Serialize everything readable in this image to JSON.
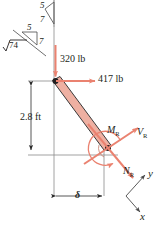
{
  "figure": {
    "type": "free-body-diagram",
    "title": "",
    "colors": {
      "member_fill": "#eeb0a2",
      "member_edge": "#3a3a3a",
      "force_arrow": "#ea8270",
      "reaction_arrow": "#ea8270",
      "line": "#555555",
      "text": "#231f20"
    },
    "forces": [
      {
        "id": "vertical-load",
        "label": "320 lb",
        "direction": "down",
        "magnitude": 320,
        "unit": "lb"
      },
      {
        "id": "horizontal-load",
        "label": "417 lb",
        "direction": "right",
        "magnitude": 417,
        "unit": "lb"
      }
    ],
    "reactions": [
      {
        "id": "moment",
        "label": "M",
        "subscript": "R"
      },
      {
        "id": "shear",
        "label": "V",
        "subscript": "R"
      },
      {
        "id": "normal",
        "label": "N",
        "subscript": "R"
      }
    ],
    "dimensions": [
      {
        "id": "vertical-dim",
        "label": "2.8 ft",
        "value": 2.8,
        "unit": "ft",
        "orientation": "vertical"
      },
      {
        "id": "horizontal-dim",
        "label": "δ",
        "value": null,
        "unit": "",
        "orientation": "horizontal"
      }
    ],
    "slope_triangles": [
      {
        "id": "upper-slope-triangle",
        "rise": "5",
        "run": "7"
      },
      {
        "id": "lower-slope-triangle",
        "rise": "5",
        "run": "7",
        "hypotenuse": "√74"
      }
    ],
    "axes": [
      {
        "id": "y-axis",
        "label": "y",
        "direction": "up-right"
      },
      {
        "id": "x-axis",
        "label": "x",
        "direction": "down-right"
      }
    ]
  }
}
